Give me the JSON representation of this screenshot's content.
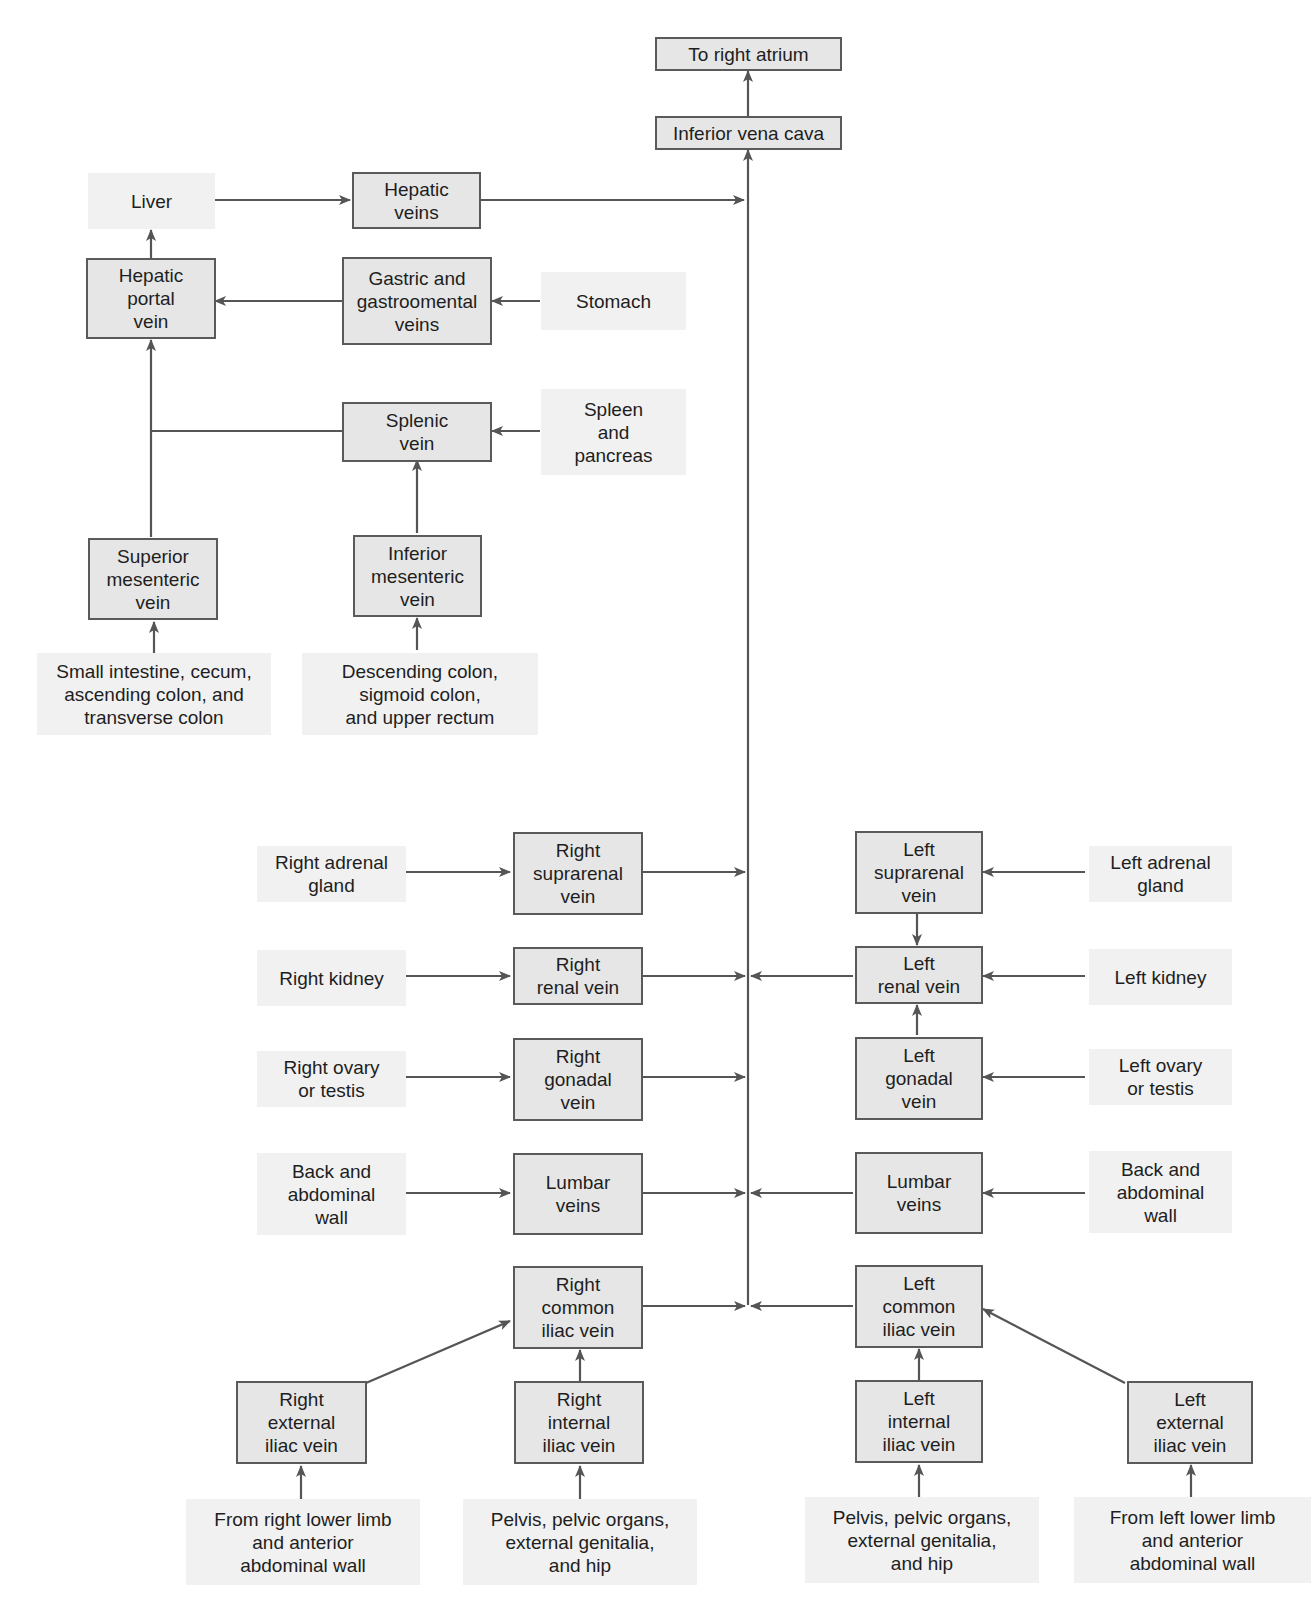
{
  "diagram": {
    "colors": {
      "vein_box_fill": "#e6e6e6",
      "vein_box_border": "#5a5a5a",
      "source_box_fill": "#f1f1f1",
      "line": "#555555",
      "text": "#1e1e1e"
    },
    "nodes": {
      "to_right_atrium": "To right atrium",
      "inferior_vena_cava": "Inferior vena cava",
      "liver": "Liver",
      "hepatic_veins": "Hepatic\nveins",
      "hepatic_portal_vein": "Hepatic\nportal\nvein",
      "gastric_veins": "Gastric and\ngastroomental\nveins",
      "stomach": "Stomach",
      "splenic_vein": "Splenic\nvein",
      "spleen_pancreas": "Spleen\nand\npancreas",
      "superior_mesenteric_vein": "Superior\nmesenteric\nvein",
      "inferior_mesenteric_vein": "Inferior\nmesenteric\nvein",
      "small_intestine": "Small intestine, cecum,\nascending colon, and\ntransverse colon",
      "descending_colon": "Descending colon,\nsigmoid colon,\nand upper rectum",
      "right_adrenal_gland": "Right adrenal\ngland",
      "right_suprarenal_vein": "Right\nsuprarenal\nvein",
      "left_suprarenal_vein": "Left\nsuprarenal\nvein",
      "left_adrenal_gland": "Left adrenal\ngland",
      "right_kidney": "Right kidney",
      "right_renal_vein": "Right\nrenal vein",
      "left_renal_vein": "Left\nrenal vein",
      "left_kidney": "Left kidney",
      "right_ovary_testis": "Right ovary\nor testis",
      "right_gonadal_vein": "Right\ngonadal\nvein",
      "left_gonadal_vein": "Left\ngonadal\nvein",
      "left_ovary_testis": "Left ovary\nor testis",
      "right_back_wall": "Back and\nabdominal\nwall",
      "right_lumbar_veins": "Lumbar\nveins",
      "left_lumbar_veins": "Lumbar\nveins",
      "left_back_wall": "Back and\nabdominal\nwall",
      "right_common_iliac_vein": "Right\ncommon\niliac vein",
      "left_common_iliac_vein": "Left\ncommon\niliac vein",
      "right_external_iliac_vein": "Right\nexternal\niliac vein",
      "right_internal_iliac_vein": "Right\ninternal\niliac vein",
      "left_internal_iliac_vein": "Left\ninternal\niliac vein",
      "left_external_iliac_vein": "Left\nexternal\niliac vein",
      "right_lower_limb": "From right lower limb\nand anterior\nabdominal wall",
      "right_pelvis": "Pelvis, pelvic organs,\nexternal genitalia,\nand hip",
      "left_pelvis": "Pelvis, pelvic organs,\nexternal genitalia,\nand hip",
      "left_lower_limb": "From left lower limb\nand anterior\nabdominal wall"
    }
  }
}
